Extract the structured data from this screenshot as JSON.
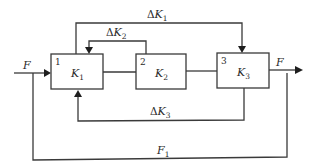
{
  "diagram": {
    "type": "block-diagram",
    "colors": {
      "stroke": "#3a3a3a",
      "arrow": "#1e1e1e",
      "text": "#2a2a2a",
      "background": "#ffffff"
    },
    "blocks": [
      {
        "id": "1",
        "number": "1",
        "symbol": "K",
        "subscript": "1"
      },
      {
        "id": "2",
        "number": "2",
        "symbol": "K",
        "subscript": "2"
      },
      {
        "id": "3",
        "number": "3",
        "symbol": "K",
        "subscript": "3"
      }
    ],
    "signals": {
      "input": {
        "symbol": "F",
        "subscript": ""
      },
      "output": {
        "symbol": "F",
        "subscript": ""
      },
      "dk1": {
        "delta": "Δ",
        "symbol": "K",
        "subscript": "1"
      },
      "dk2": {
        "delta": "Δ",
        "symbol": "K",
        "subscript": "2"
      },
      "dk3": {
        "delta": "Δ",
        "symbol": "K",
        "subscript": "3"
      },
      "f1": {
        "symbol": "F",
        "subscript": "1"
      }
    },
    "connections": [
      {
        "from": "input F",
        "to": "block 1"
      },
      {
        "from": "block 1",
        "to": "block 2"
      },
      {
        "from": "block 2",
        "to": "block 3"
      },
      {
        "from": "block 3",
        "to": "output F"
      },
      {
        "from": "block 1 (top)",
        "to": "block 3 (top)",
        "label": "ΔK1"
      },
      {
        "from": "block 2 (top)",
        "to": "block 1 (top)",
        "label": "ΔK2"
      },
      {
        "from": "block 3 (bottom)",
        "to": "block 1 (bottom)",
        "label": "ΔK3"
      },
      {
        "from": "output F",
        "to": "input F",
        "label": "F1"
      }
    ]
  }
}
